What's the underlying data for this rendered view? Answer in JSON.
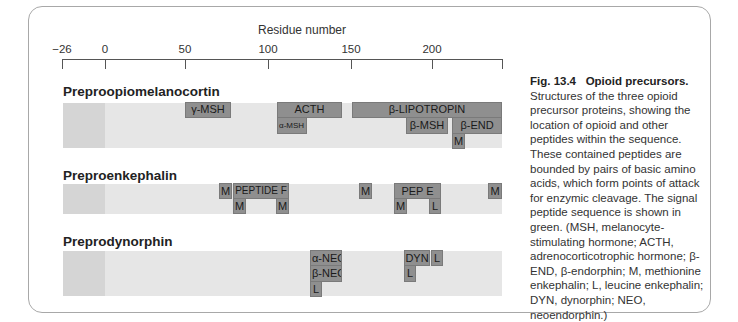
{
  "axis": {
    "title": "Residue number",
    "ticks": [
      {
        "label": "−26",
        "value": -26
      },
      {
        "label": "0",
        "value": 0
      },
      {
        "label": "50",
        "value": 50
      },
      {
        "label": "100",
        "value": 100
      },
      {
        "label": "150",
        "value": 150
      },
      {
        "label": "200",
        "value": 200
      },
      {
        "label": "",
        "value": 241
      }
    ]
  },
  "rows": [
    {
      "name": "Preproopiomelanocortin",
      "peptides": [
        {
          "label": "γ-MSH"
        },
        {
          "label": "ACTH"
        },
        {
          "label": "α-MSH"
        },
        {
          "label": "β-LIPOTROPIN"
        },
        {
          "label": "β-MSH"
        },
        {
          "label": "β-END"
        },
        {
          "label": "M"
        }
      ]
    },
    {
      "name": "Preproenkephalin",
      "peptides": [
        {
          "label": "M"
        },
        {
          "label": "PEPTIDE F"
        },
        {
          "label": "M"
        },
        {
          "label": "M"
        },
        {
          "label": "M"
        },
        {
          "label": "PEP E"
        },
        {
          "label": "M"
        },
        {
          "label": "L"
        },
        {
          "label": "M"
        }
      ]
    },
    {
      "name": "Preprodynorphin",
      "peptides": [
        {
          "label": "α-NEO"
        },
        {
          "label": "β-NEO"
        },
        {
          "label": "L"
        },
        {
          "label": "DYN"
        },
        {
          "label": "L"
        },
        {
          "label": "L"
        }
      ]
    }
  ],
  "caption": {
    "figure_label": "Fig. 13.4",
    "title": "Opioid precursors.",
    "body": "Structures of the three opioid precursor proteins, showing the location of opioid and other peptides within the sequence. These contained peptides are bounded by pairs of basic amino acids, which form points of attack for enzymic cleavage. The signal peptide sequence is shown in green. (MSH, melanocyte-stimulating hormone; ACTH, adrenocorticotrophic hormone; β-END, β-endorphin; M, methionine enkephalin; L, leucine enkephalin; DYN, dynorphin; NEO, neoendorphin.)"
  },
  "colors": {
    "peptide_box": "#8f8f8f",
    "track": "#e6e6e6",
    "signal_peptide": "#d5d5d5",
    "frame": "#a8a8a8"
  }
}
